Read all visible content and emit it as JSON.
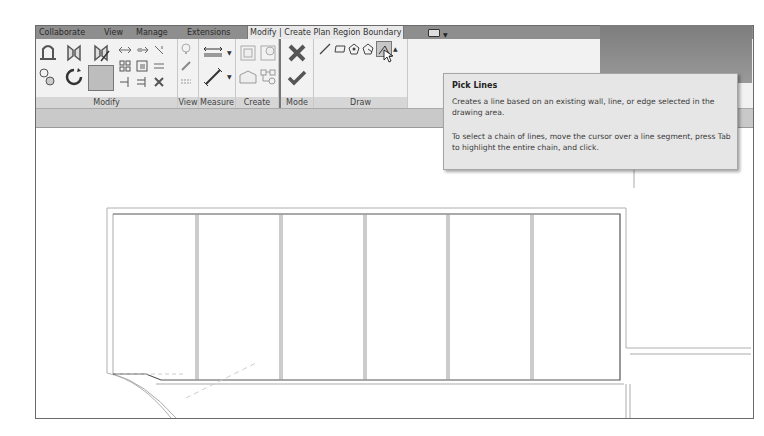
{
  "ribbon": {
    "tabs": [
      {
        "label": "Collaborate",
        "active": false
      },
      {
        "label": "View",
        "active": false
      },
      {
        "label": "Manage",
        "active": false
      },
      {
        "label": "Extensions",
        "active": false
      },
      {
        "label": "Modify | Create Plan Region Boundary",
        "active": true
      }
    ],
    "panels": [
      {
        "label": "Modify",
        "tools": [
          "align-icon",
          "offset-icon",
          "mirror-pick-axis-icon",
          "mirror-draw-axis-icon",
          "move-icon",
          "copy-icon",
          "rotate-icon",
          "trim-extend-corner-icon",
          "split-icon",
          "array-icon",
          "scale-icon",
          "pin-icon",
          "unpin-icon",
          "delete-icon",
          "trim-extend-single-icon",
          "trim-extend-multiple-icon",
          "copy-paste-icon"
        ]
      },
      {
        "label": "View",
        "tools": [
          "hide-icon",
          "override-graphics-icon",
          "linework-icon"
        ]
      },
      {
        "label": "Measure",
        "tools": [
          "measure-icon",
          "dimension-icon"
        ]
      },
      {
        "label": "Create",
        "tools": [
          "create-assembly-icon",
          "create-parts-icon",
          "create-group-icon",
          "create-similar-icon"
        ]
      },
      {
        "label": "Mode",
        "tools": [
          "cancel-edit-icon",
          "finish-edit-icon"
        ]
      },
      {
        "label": "Draw",
        "tools": [
          "line-icon",
          "rectangle-icon",
          "inscribed-polygon-icon",
          "circumscribed-polygon-icon",
          "pick-lines-icon"
        ]
      }
    ]
  },
  "tooltip": {
    "title": "Pick Lines",
    "description": "Creates a line based on an existing wall, line, or edge selected in the drawing area.",
    "instructions": "To select a chain of lines, move the cursor over a line segment, press Tab to highlight the entire chain, and click."
  }
}
